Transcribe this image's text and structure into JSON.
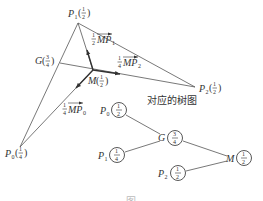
{
  "figure": {
    "geometry": {
      "points": [
        {
          "id": "P1",
          "label": "P",
          "sub": "1",
          "mass_num": "1",
          "mass_den": "2"
        },
        {
          "id": "P2",
          "label": "P",
          "sub": "2",
          "mass_num": "1",
          "mass_den": "2"
        },
        {
          "id": "P0",
          "label": "P",
          "sub": "0",
          "mass_num": "1",
          "mass_den": "4"
        },
        {
          "id": "G",
          "label": "G",
          "mass_num": "3",
          "mass_den": "4"
        },
        {
          "id": "M",
          "label": "M",
          "mass_num": "1",
          "mass_den": "2"
        }
      ],
      "vectors": [
        {
          "coef_num": "1",
          "coef_den": "2",
          "name": "MP",
          "sub": "1"
        },
        {
          "coef_num": "1",
          "coef_den": "4",
          "name": "MP",
          "sub": "2"
        },
        {
          "coef_num": "1",
          "coef_den": "4",
          "name": "MP",
          "sub": "0"
        }
      ]
    },
    "tree": {
      "caption": "对应的树图",
      "nodes": [
        {
          "id": "P0",
          "label": "P",
          "sub": "0",
          "mass_num": "1",
          "mass_den": "2"
        },
        {
          "id": "G",
          "label": "G",
          "mass_num": "3",
          "mass_den": "4"
        },
        {
          "id": "P1",
          "label": "P",
          "sub": "1",
          "mass_num": "1",
          "mass_den": "4"
        },
        {
          "id": "M",
          "label": "M",
          "mass_num": "1",
          "mass_den": "2"
        },
        {
          "id": "P2",
          "label": "P",
          "sub": "2",
          "mass_num": "1",
          "mass_den": "2"
        }
      ],
      "edges": [
        [
          "P0",
          "G"
        ],
        [
          "P1",
          "G"
        ],
        [
          "G",
          "M"
        ],
        [
          "P2",
          "M"
        ]
      ]
    },
    "bottom_caption": "图"
  }
}
